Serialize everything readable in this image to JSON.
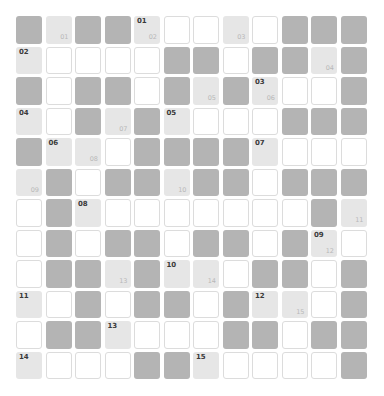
{
  "puzzle": {
    "rows": 12,
    "cols": 12,
    "legend": {
      "D": "blocked",
      "L": "clue-start",
      "W": "empty"
    },
    "colors": {
      "blocked": "#b4b4b4",
      "clue": "#e6e6e6",
      "empty": "#ffffff",
      "border": "#dcdcdc"
    },
    "grid": [
      [
        {
          "t": "D"
        },
        {
          "t": "L",
          "br": "01"
        },
        {
          "t": "D"
        },
        {
          "t": "D"
        },
        {
          "t": "L",
          "tl": "01",
          "br": "02"
        },
        {
          "t": "W"
        },
        {
          "t": "W"
        },
        {
          "t": "L",
          "br": "03"
        },
        {
          "t": "W"
        },
        {
          "t": "D"
        },
        {
          "t": "D"
        },
        {
          "t": "D"
        }
      ],
      [
        {
          "t": "L",
          "tl": "02"
        },
        {
          "t": "W"
        },
        {
          "t": "W"
        },
        {
          "t": "W"
        },
        {
          "t": "W"
        },
        {
          "t": "D"
        },
        {
          "t": "D"
        },
        {
          "t": "W"
        },
        {
          "t": "D"
        },
        {
          "t": "D"
        },
        {
          "t": "L",
          "br": "04"
        },
        {
          "t": "D"
        }
      ],
      [
        {
          "t": "D"
        },
        {
          "t": "W"
        },
        {
          "t": "D"
        },
        {
          "t": "D"
        },
        {
          "t": "W"
        },
        {
          "t": "D"
        },
        {
          "t": "L",
          "br": "05"
        },
        {
          "t": "D"
        },
        {
          "t": "L",
          "tl": "03",
          "br": "06"
        },
        {
          "t": "W"
        },
        {
          "t": "W"
        },
        {
          "t": "D"
        }
      ],
      [
        {
          "t": "L",
          "tl": "04"
        },
        {
          "t": "W"
        },
        {
          "t": "D"
        },
        {
          "t": "L",
          "br": "07"
        },
        {
          "t": "D"
        },
        {
          "t": "L",
          "tl": "05"
        },
        {
          "t": "W"
        },
        {
          "t": "W"
        },
        {
          "t": "W"
        },
        {
          "t": "D"
        },
        {
          "t": "D"
        },
        {
          "t": "D"
        }
      ],
      [
        {
          "t": "D"
        },
        {
          "t": "L",
          "tl": "06"
        },
        {
          "t": "L",
          "br": "08"
        },
        {
          "t": "W"
        },
        {
          "t": "D"
        },
        {
          "t": "D"
        },
        {
          "t": "D"
        },
        {
          "t": "D"
        },
        {
          "t": "L",
          "tl": "07"
        },
        {
          "t": "W"
        },
        {
          "t": "W"
        },
        {
          "t": "W"
        }
      ],
      [
        {
          "t": "L",
          "br": "09"
        },
        {
          "t": "D"
        },
        {
          "t": "W"
        },
        {
          "t": "D"
        },
        {
          "t": "D"
        },
        {
          "t": "L",
          "br": "10"
        },
        {
          "t": "D"
        },
        {
          "t": "D"
        },
        {
          "t": "W"
        },
        {
          "t": "D"
        },
        {
          "t": "D"
        },
        {
          "t": "D"
        }
      ],
      [
        {
          "t": "W"
        },
        {
          "t": "D"
        },
        {
          "t": "L",
          "tl": "08"
        },
        {
          "t": "W"
        },
        {
          "t": "W"
        },
        {
          "t": "W"
        },
        {
          "t": "W"
        },
        {
          "t": "W"
        },
        {
          "t": "W"
        },
        {
          "t": "W"
        },
        {
          "t": "D"
        },
        {
          "t": "L",
          "br": "11"
        }
      ],
      [
        {
          "t": "W"
        },
        {
          "t": "D"
        },
        {
          "t": "W"
        },
        {
          "t": "D"
        },
        {
          "t": "D"
        },
        {
          "t": "W"
        },
        {
          "t": "D"
        },
        {
          "t": "D"
        },
        {
          "t": "W"
        },
        {
          "t": "D"
        },
        {
          "t": "L",
          "tl": "09",
          "br": "12"
        },
        {
          "t": "W"
        }
      ],
      [
        {
          "t": "W"
        },
        {
          "t": "D"
        },
        {
          "t": "D"
        },
        {
          "t": "L",
          "br": "13"
        },
        {
          "t": "D"
        },
        {
          "t": "L",
          "tl": "10"
        },
        {
          "t": "L",
          "br": "14"
        },
        {
          "t": "W"
        },
        {
          "t": "D"
        },
        {
          "t": "D"
        },
        {
          "t": "W"
        },
        {
          "t": "D"
        }
      ],
      [
        {
          "t": "L",
          "tl": "11"
        },
        {
          "t": "W"
        },
        {
          "t": "D"
        },
        {
          "t": "W"
        },
        {
          "t": "D"
        },
        {
          "t": "D"
        },
        {
          "t": "W"
        },
        {
          "t": "D"
        },
        {
          "t": "L",
          "tl": "12"
        },
        {
          "t": "L",
          "br": "15"
        },
        {
          "t": "W"
        },
        {
          "t": "D"
        }
      ],
      [
        {
          "t": "W"
        },
        {
          "t": "D"
        },
        {
          "t": "D"
        },
        {
          "t": "L",
          "tl": "13"
        },
        {
          "t": "W"
        },
        {
          "t": "W"
        },
        {
          "t": "W"
        },
        {
          "t": "D"
        },
        {
          "t": "D"
        },
        {
          "t": "W"
        },
        {
          "t": "D"
        },
        {
          "t": "D"
        }
      ],
      [
        {
          "t": "L",
          "tl": "14"
        },
        {
          "t": "W"
        },
        {
          "t": "W"
        },
        {
          "t": "W"
        },
        {
          "t": "D"
        },
        {
          "t": "D"
        },
        {
          "t": "L",
          "tl": "15"
        },
        {
          "t": "W"
        },
        {
          "t": "W"
        },
        {
          "t": "W"
        },
        {
          "t": "W"
        },
        {
          "t": "D"
        }
      ]
    ]
  }
}
